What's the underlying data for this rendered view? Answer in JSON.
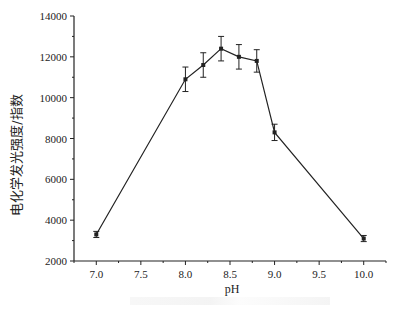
{
  "chart_data": {
    "type": "line",
    "title": "",
    "xlabel": "pH",
    "ylabel": "电化学发光强度/指数",
    "xlim": [
      6.75,
      10.25
    ],
    "ylim": [
      2000,
      14000
    ],
    "x_ticks": [
      "7.0",
      "7.5",
      "8.0",
      "8.5",
      "9.0",
      "9.5",
      "10.0"
    ],
    "y_ticks": [
      "2000",
      "4000",
      "6000",
      "8000",
      "10000",
      "12000",
      "14000"
    ],
    "grid": false,
    "legend": null,
    "series": [
      {
        "name": "ECL intensity",
        "x": [
          7.0,
          8.0,
          8.2,
          8.4,
          8.6,
          8.8,
          9.0,
          10.0
        ],
        "values": [
          3300,
          10900,
          11600,
          12400,
          12000,
          11800,
          8300,
          3100
        ],
        "error": [
          150,
          600,
          600,
          600,
          600,
          550,
          400,
          150
        ],
        "marker": "square",
        "color": "#222222"
      }
    ]
  },
  "labels": {
    "xlabel": "pH",
    "ylabel": "电化学发光强度/指数"
  }
}
